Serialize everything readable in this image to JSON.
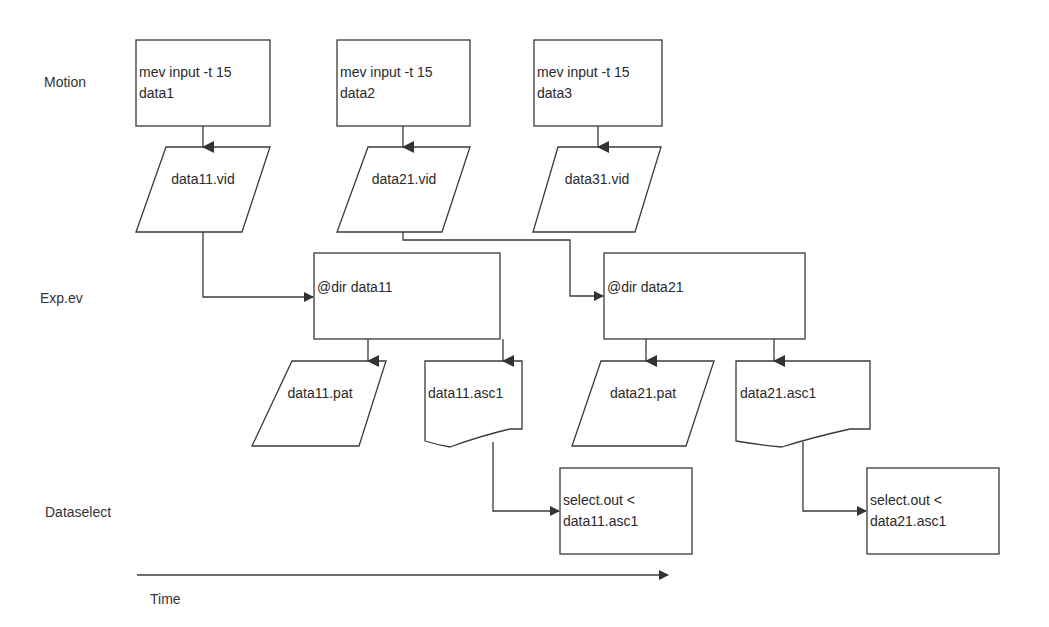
{
  "lanes": {
    "motion": "Motion",
    "exp_ev": "Exp.ev",
    "dataselect": "Dataselect"
  },
  "time_axis": {
    "label": "Time"
  },
  "motion_nodes": [
    {
      "line1": "mev input -t 15",
      "line2": "data1"
    },
    {
      "line1": "mev input -t 15",
      "line2": "data2"
    },
    {
      "line1": "mev input -t 15",
      "line2": "data3"
    }
  ],
  "vid_files": [
    "data11.vid",
    "data21.vid",
    "data31.vid"
  ],
  "exp_nodes": [
    "@dir data11",
    "@dir data21"
  ],
  "pat_files": [
    "data11.pat",
    "data21.pat"
  ],
  "asc_files": [
    "data11.asc1",
    "data21.asc1"
  ],
  "select_nodes": [
    {
      "line1": "select.out <",
      "line2": "data11.asc1"
    },
    {
      "line1": "select.out <",
      "line2": "data21.asc1"
    }
  ],
  "colors": {
    "stroke": "#3a3a3a",
    "text": "#2a2a2a",
    "background": "#ffffff"
  }
}
